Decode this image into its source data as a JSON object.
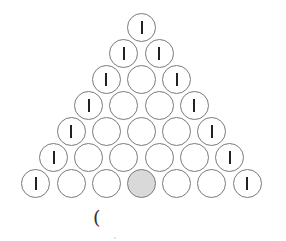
{
  "diagram": {
    "type": "triangular-circle-arrangement",
    "rows": [
      [
        "I"
      ],
      [
        "I",
        "I"
      ],
      [
        "I",
        "",
        "I"
      ],
      [
        "I",
        "",
        "",
        "I"
      ],
      [
        "I",
        "",
        "",
        "",
        "I"
      ],
      [
        "I",
        "",
        "",
        "",
        "",
        "I"
      ],
      [
        "I",
        "",
        "",
        "shaded",
        "",
        "",
        "I"
      ]
    ],
    "colors": {
      "outline": "#7a7a7a",
      "shaded_fill": "#d9d9d9",
      "mark": "#222222"
    }
  },
  "caption": {
    "text": "("
  }
}
